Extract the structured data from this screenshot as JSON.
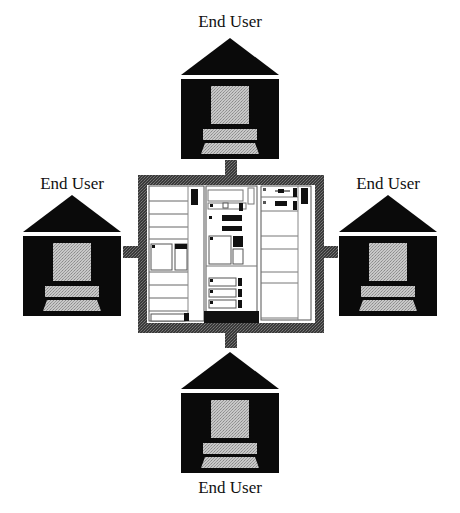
{
  "diagram": {
    "type": "star-network",
    "center": {
      "label": "",
      "kind": "mainframe-computer-rack"
    },
    "nodes": [
      {
        "id": "top",
        "label": "End User",
        "kind": "house-with-terminal"
      },
      {
        "id": "left",
        "label": "End User",
        "kind": "house-with-terminal"
      },
      {
        "id": "right",
        "label": "End User",
        "kind": "house-with-terminal"
      },
      {
        "id": "bottom",
        "label": "End User",
        "kind": "house-with-terminal"
      }
    ],
    "edges": [
      {
        "from": "center",
        "to": "top"
      },
      {
        "from": "center",
        "to": "left"
      },
      {
        "from": "center",
        "to": "right"
      },
      {
        "from": "center",
        "to": "bottom"
      }
    ]
  },
  "colors": {
    "house": "#0a0a0a",
    "screen": "#bdbdbd",
    "link": "#555555",
    "rack_border": "#4a4a4a"
  }
}
